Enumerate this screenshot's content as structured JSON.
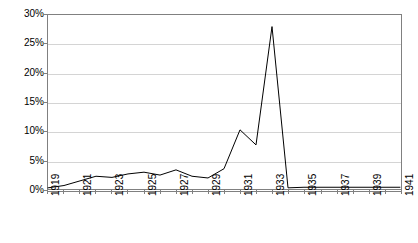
{
  "chart_data": {
    "type": "line",
    "title": "",
    "subtitle": "",
    "xlabel": "",
    "ylabel": "",
    "x": [
      1919,
      1920,
      1921,
      1922,
      1923,
      1924,
      1925,
      1926,
      1927,
      1928,
      1929,
      1930,
      1931,
      1932,
      1933,
      1934,
      1935,
      1936,
      1937,
      1938,
      1939,
      1940,
      1941
    ],
    "values": [
      0.2,
      0.6,
      1.4,
      2.2,
      2.0,
      2.6,
      2.9,
      2.4,
      3.3,
      2.2,
      1.9,
      3.5,
      10.2,
      7.6,
      28.0,
      0.2,
      0.3,
      0.3,
      0.3,
      0.3,
      0.3,
      0.3,
      0.3
    ],
    "series": [
      {
        "name": "",
        "values": [
          0.2,
          0.6,
          1.4,
          2.2,
          2.0,
          2.6,
          2.9,
          2.4,
          3.3,
          2.2,
          1.9,
          3.5,
          10.2,
          7.6,
          28.0,
          0.2,
          0.3,
          0.3,
          0.3,
          0.3,
          0.3,
          0.3,
          0.3
        ]
      }
    ],
    "ylim": [
      0,
      30
    ],
    "xlim": [
      1919,
      1941
    ],
    "ytick_values": [
      0,
      5,
      10,
      15,
      20,
      25,
      30
    ],
    "ytick_labels": [
      "0%",
      "5%",
      "10%",
      "15%",
      "20%",
      "25%",
      "30%"
    ],
    "xtick_values": [
      1919,
      1921,
      1923,
      1925,
      1927,
      1929,
      1931,
      1933,
      1935,
      1937,
      1939,
      1941
    ],
    "xtick_labels": [
      "1919",
      "1921",
      "1923",
      "1925",
      "1927",
      "1929",
      "1931",
      "1933",
      "1935",
      "1937",
      "1939",
      "1941"
    ],
    "grid": "horizontal",
    "legend": "none",
    "line_color": "#000000",
    "grid_color": "#d4d4d4",
    "axis_color": "#808080",
    "background_color": "#ffffff",
    "annotations": []
  }
}
